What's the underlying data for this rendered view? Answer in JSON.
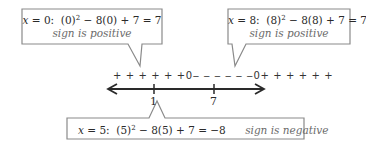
{
  "callouts": {
    "left": {
      "x_var": "x",
      "x_value": "= 0:",
      "expr_a": "(0)",
      "exponent": "2",
      "expr_b": "− 8(0) + 7 = 7",
      "sign": "sign is positive"
    },
    "right": {
      "x_var": "x",
      "x_value": "= 8:",
      "expr_a": "(8)",
      "exponent": "2",
      "expr_b": "− 8(8) + 7 = 7",
      "sign": "sign is positive"
    },
    "bottom": {
      "x_var": "x",
      "x_value": "= 5:",
      "expr_a": "(5)",
      "exponent": "2",
      "expr_b": "− 8(5) + 7 = −8",
      "sign": "sign is negative"
    }
  },
  "number_line": {
    "sign_row": {
      "left": "+ + + + + +",
      "zero1": "0",
      "middle": "‒ ‒ ‒ ‒ ‒ ‒",
      "zero2": "0",
      "right": "+ + + + + +"
    },
    "ticks": [
      {
        "label": "1"
      },
      {
        "label": "7"
      }
    ]
  },
  "colors": {
    "box_border": "#8a8a8a",
    "line": "#2a2a2a",
    "sign_text": "#6a6a6a"
  }
}
